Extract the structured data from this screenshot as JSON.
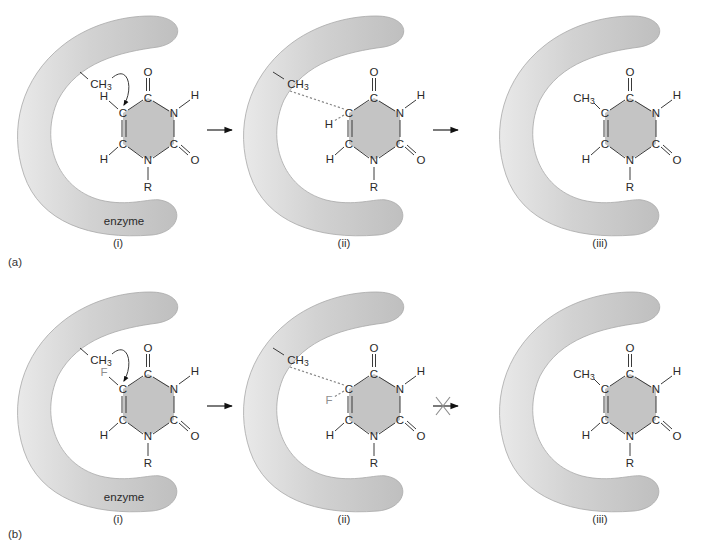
{
  "figure": {
    "rows": [
      {
        "label": "(a)",
        "panels": [
          {
            "caption": "(i)",
            "enzyme_label": "enzyme",
            "substituent": "H",
            "substituent_grey": false,
            "methyl": "CH3",
            "state": "attack"
          },
          {
            "caption": "(ii)",
            "enzyme_label": "",
            "substituent": "H",
            "substituent_grey": false,
            "methyl": "CH3",
            "state": "transition"
          },
          {
            "caption": "(iii)",
            "enzyme_label": "",
            "substituent": "",
            "substituent_grey": false,
            "methyl": "CH3",
            "state": "product"
          }
        ],
        "arrows": [
          {
            "type": "forward"
          },
          {
            "type": "forward"
          }
        ]
      },
      {
        "label": "(b)",
        "panels": [
          {
            "caption": "(i)",
            "enzyme_label": "enzyme",
            "substituent": "F",
            "substituent_grey": true,
            "methyl": "CH3",
            "state": "attack"
          },
          {
            "caption": "(ii)",
            "enzyme_label": "",
            "substituent": "F",
            "substituent_grey": true,
            "methyl": "CH3",
            "state": "transition"
          },
          {
            "caption": "(iii)",
            "enzyme_label": "",
            "substituent": "",
            "substituent_grey": false,
            "methyl": "CH3",
            "state": "product"
          }
        ],
        "arrows": [
          {
            "type": "forward"
          },
          {
            "type": "blocked"
          }
        ]
      }
    ],
    "atoms": {
      "carbon": "C",
      "nitrogen": "N",
      "oxygen": "O",
      "hydrogen": "H",
      "r_group": "R",
      "methyl_base": "CH",
      "methyl_sub": "3"
    },
    "colors": {
      "enzyme_light": "#e6e6e6",
      "enzyme_dark": "#c2c2c2",
      "ring_fill": "#c4c4c4",
      "bond": "#3a3a3a",
      "dashed_bond": "#8a8a8a",
      "fluorine": "#8f8f8f"
    }
  }
}
